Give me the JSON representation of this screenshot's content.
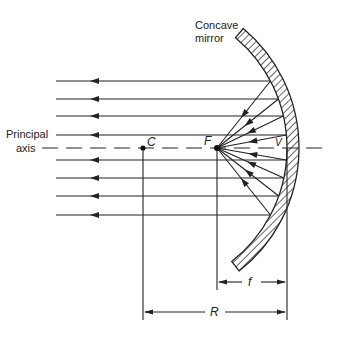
{
  "diagram": {
    "title_label": [
      "Concave",
      "mirror"
    ],
    "axis_label": [
      "Principal",
      "axis"
    ],
    "points": {
      "C": {
        "label": "C",
        "x": 143,
        "y": 148
      },
      "F": {
        "label": "F",
        "x": 217,
        "y": 148
      },
      "V": {
        "label": "V",
        "x": 287,
        "y": 148
      }
    },
    "dimensions": {
      "f": {
        "label": "f",
        "from_x": 217,
        "to_x": 287,
        "y": 282
      },
      "R": {
        "label": "R",
        "from_x": 143,
        "to_x": 287,
        "y": 312
      }
    },
    "rays_y": [
      81,
      99,
      116,
      135,
      160,
      178,
      196,
      215
    ],
    "colors": {
      "line": "#222222",
      "background": "#ffffff"
    }
  }
}
